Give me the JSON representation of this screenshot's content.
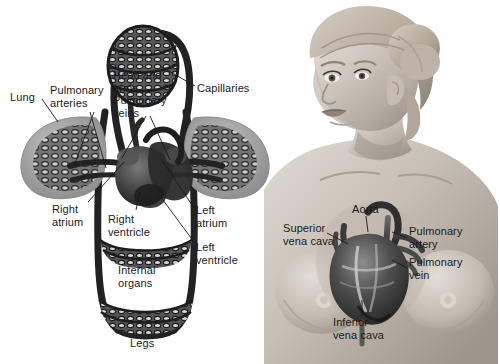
{
  "figure": {
    "background_color": "#ffffff",
    "text_color": "#1a1a1a",
    "panels": 2
  },
  "left_panel": {
    "name": "circulatory-schematic",
    "labels": [
      {
        "id": "lung",
        "text": "Lung",
        "x": 10,
        "y": 91,
        "align": "left"
      },
      {
        "id": "pulmonary-arteries",
        "text": "Pulmonary\narteries",
        "x": 50,
        "y": 84,
        "align": "left"
      },
      {
        "id": "head-and-arms",
        "text": "Head and\narms",
        "x": 113,
        "y": 69,
        "align": "left"
      },
      {
        "id": "pulmonary-veins",
        "text": "Pulmonary\nveins",
        "x": 113,
        "y": 94,
        "align": "left"
      },
      {
        "id": "capillaries",
        "text": "Capillaries",
        "x": 197,
        "y": 82,
        "align": "left"
      },
      {
        "id": "right-atrium",
        "text": "Right\natrium",
        "x": 52,
        "y": 203,
        "align": "left"
      },
      {
        "id": "right-ventricle",
        "text": "Right\nventricle",
        "x": 108,
        "y": 213,
        "align": "left"
      },
      {
        "id": "left-atrium",
        "text": "Left\natrium",
        "x": 196,
        "y": 204,
        "align": "left"
      },
      {
        "id": "left-ventricle",
        "text": "Left\nventricle",
        "x": 196,
        "y": 241,
        "align": "left"
      },
      {
        "id": "internal-organs",
        "text": "Internal\norgans",
        "x": 118,
        "y": 264,
        "align": "left"
      },
      {
        "id": "legs",
        "text": "Legs",
        "x": 130,
        "y": 337,
        "align": "left"
      }
    ],
    "structures": [
      {
        "id": "head-arms-capillary-bed",
        "kind": "capillary-bed"
      },
      {
        "id": "left-lung",
        "kind": "lung"
      },
      {
        "id": "right-lung",
        "kind": "lung"
      },
      {
        "id": "heart",
        "kind": "heart"
      },
      {
        "id": "internal-organs-bed",
        "kind": "capillary-bed"
      },
      {
        "id": "legs-bed",
        "kind": "capillary-bed"
      }
    ]
  },
  "right_panel": {
    "name": "woman-torso-with-heart",
    "subject": "female figure, head turned to her right, bare torso",
    "labels": [
      {
        "id": "aorta",
        "text": "Aorta",
        "x": 352,
        "y": 203,
        "align": "left"
      },
      {
        "id": "superior-vena-cava",
        "text": "Superior\nvena cava",
        "x": 283,
        "y": 222,
        "align": "left"
      },
      {
        "id": "pulmonary-artery",
        "text": "Pulmonary\nartery",
        "x": 409,
        "y": 225,
        "align": "left"
      },
      {
        "id": "pulmonary-vein",
        "text": "Pulmonary\nvein",
        "x": 409,
        "y": 256,
        "align": "left"
      },
      {
        "id": "inferior-vena-cava",
        "text": "Inferior\nvena cava",
        "x": 333,
        "y": 316,
        "align": "left"
      }
    ],
    "structures": [
      {
        "id": "heart-in-situ",
        "kind": "heart"
      }
    ]
  },
  "palette": {
    "vessel_dark": "#262626",
    "vessel_mid": "#4a4a4a",
    "bed_fill": "#5a5a5a",
    "lung_fill": "#9a9a9a",
    "skin_light": "#d8d2cc",
    "skin_mid": "#b8b0a8",
    "skin_shadow": "#8e857d",
    "hair": "#b9b2a7",
    "heart_dark": "#3a3a3a",
    "heart_mid": "#6e6e6e"
  }
}
